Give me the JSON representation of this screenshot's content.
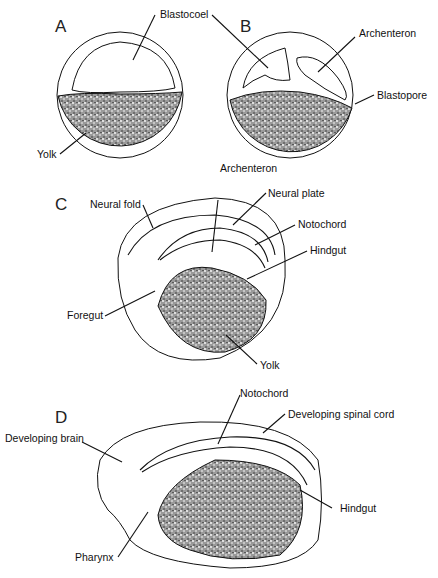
{
  "panels": {
    "A": {
      "letter": "A",
      "labels": {
        "blastocoel": "Blastocoel",
        "yolk": "Yolk"
      }
    },
    "B": {
      "letter": "B",
      "labels": {
        "archenteron": "Archenteron",
        "blastopore": "Blastopore"
      }
    },
    "C": {
      "letter": "C",
      "labels": {
        "neural_fold": "Neural fold",
        "archenteron": "Archenteron",
        "neural_plate": "Neural plate",
        "notochord": "Notochord",
        "hindgut": "Hindgut",
        "foregut": "Foregut",
        "yolk": "Yolk"
      }
    },
    "D": {
      "letter": "D",
      "labels": {
        "notochord": "Notochord",
        "developing_spinal_cord": "Developing spinal cord",
        "developing_brain": "Developing brain",
        "hindgut": "Hindgut",
        "pharynx": "Pharynx"
      }
    }
  }
}
